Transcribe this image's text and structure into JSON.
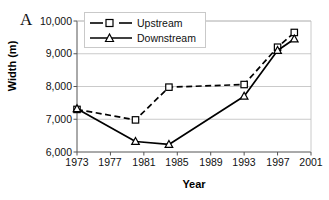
{
  "panel": {
    "label": "A"
  },
  "axes": {
    "ylabel": "Width (m)",
    "xlabel": "Year",
    "yticks": [
      "6,000",
      "7,000",
      "8,000",
      "9,000",
      "10,000"
    ],
    "xticks": [
      "1973",
      "1977",
      "1981",
      "1985",
      "1989",
      "1993",
      "1997",
      "2001"
    ]
  },
  "legend": {
    "items": [
      {
        "label": "Upstream",
        "marker": "open-square",
        "line": "dashed",
        "color": "#000000"
      },
      {
        "label": "Downstream",
        "marker": "open-triangle",
        "line": "solid",
        "color": "#000000"
      }
    ]
  },
  "chart_data": {
    "type": "line",
    "title": "",
    "subtitle": "",
    "xlabel": "Year",
    "ylabel": "Width (m)",
    "xlim": [
      1973,
      2001
    ],
    "ylim": [
      6000,
      10000
    ],
    "yticks": [
      6000,
      7000,
      8000,
      9000,
      10000
    ],
    "xticks": [
      1973,
      1977,
      1981,
      1985,
      1989,
      1993,
      1997,
      2001
    ],
    "grid": "horizontal",
    "legend_position": "top-left-inside",
    "annotations": [
      {
        "text": "A",
        "position": "outside-top-left"
      }
    ],
    "series": [
      {
        "name": "Upstream",
        "marker": "open-square",
        "linestyle": "dashed",
        "color": "#000000",
        "x": [
          1973,
          1980,
          1984,
          1993,
          1997,
          1999
        ],
        "y": [
          7300,
          6980,
          7980,
          8060,
          9200,
          9650
        ]
      },
      {
        "name": "Downstream",
        "marker": "open-triangle",
        "linestyle": "solid",
        "color": "#000000",
        "x": [
          1973,
          1980,
          1984,
          1993,
          1997,
          1999
        ],
        "y": [
          7320,
          6320,
          6230,
          7700,
          9100,
          9450
        ]
      }
    ]
  }
}
